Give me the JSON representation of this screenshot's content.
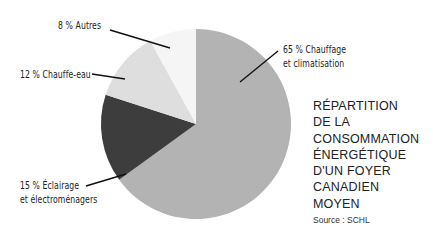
{
  "chart_data": {
    "type": "pie",
    "title": "RÉPARTITION DE LA CONSOMMATION ÉNERGÉTIQUE D'UN FOYER CANADIEN MOYEN",
    "source": "Source : SCHL",
    "categories": [
      "Chauffage et climatisation",
      "Éclairage et électroménagers",
      "Chauffe-eau",
      "Autres"
    ],
    "values": [
      65,
      15,
      12,
      8
    ],
    "unit": "%",
    "colors": [
      "#b3b3b3",
      "#3d3d3d",
      "#dedede",
      "#f5f5f5"
    ],
    "legend": "none (direct labels)"
  },
  "labels": {
    "chauffage_line1": "65 % Chauffage",
    "chauffage_line2": "et climatisation",
    "eclairage_line1": "15 % Éclairage",
    "eclairage_line2": "et électroménagers",
    "chauffe_eau": "12 % Chauffe-eau",
    "autres": "8 % Autres"
  },
  "title_lines": [
    "RÉPARTITION",
    "DE LA",
    "CONSOMMATION",
    "ÉNERGÉTIQUE",
    "D'UN FOYER",
    "CANADIEN",
    "MOYEN"
  ],
  "source": "Source : SCHL"
}
